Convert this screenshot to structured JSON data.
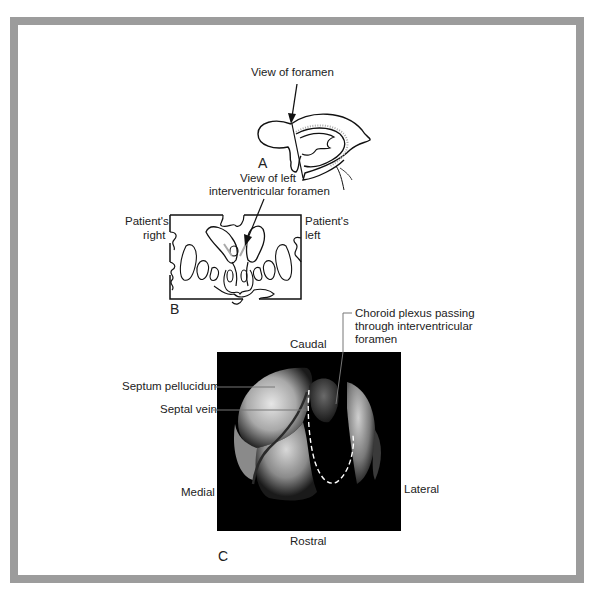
{
  "figure": {
    "border_color": "#9c9c9c",
    "panel_a": {
      "letter": "A",
      "arrow_label": "View of foramen"
    },
    "panel_b": {
      "letter": "B",
      "arrow_label_line1": "View of left",
      "arrow_label_line2": "interventricular foramen",
      "left_side_line1": "Patient's",
      "left_side_line2": "right",
      "right_side_line1": "Patient's",
      "right_side_line2": "left"
    },
    "panel_c": {
      "letter": "C",
      "top_label": "Caudal",
      "bottom_label": "Rostral",
      "left_label": "Medial",
      "right_label": "Lateral",
      "callouts": {
        "septum": "Septum pellucidum",
        "septal_vein": "Septal vein",
        "choroid_line1": "Choroid plexus passing",
        "choroid_line2": "through interventricular",
        "choroid_line3": "foramen"
      }
    }
  }
}
